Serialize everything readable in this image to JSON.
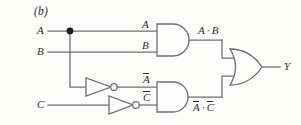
{
  "figure": {
    "panel_label": "(b)",
    "type": "logic-circuit-diagram",
    "colors": {
      "background": "#fdfdfc",
      "wire": "#6e6e6e",
      "text": "#2b2b2b",
      "junction": "#1c1c1c"
    }
  },
  "inputs": [
    {
      "name": "input-a",
      "label": "A"
    },
    {
      "name": "input-b",
      "label": "B"
    },
    {
      "name": "input-c",
      "label": "C"
    }
  ],
  "output": {
    "name": "output-y",
    "label": "Y"
  },
  "gate_input_labels": {
    "and1_top": "A",
    "and1_bottom": "B",
    "and2_top": "A",
    "and2_top_overbar": true,
    "and2_bottom": "C",
    "and2_bottom_overbar": true
  },
  "intermediate_labels": {
    "and1_output": {
      "left": "A",
      "sep": "·",
      "right": "B"
    },
    "and2_output": {
      "left": "A",
      "sep": "·",
      "right": "C"
    }
  },
  "gates": [
    {
      "name": "and-gate-1",
      "type": "AND",
      "inputs": [
        "A",
        "B"
      ],
      "output": "A · B"
    },
    {
      "name": "not-gate-a",
      "type": "NOT",
      "inputs": [
        "A"
      ],
      "output": "Ā"
    },
    {
      "name": "not-gate-c",
      "type": "NOT",
      "inputs": [
        "C"
      ],
      "output": "C̄"
    },
    {
      "name": "and-gate-2",
      "type": "AND",
      "inputs": [
        "Ā",
        "C̄"
      ],
      "output": "Ā · C̄"
    },
    {
      "name": "or-gate-1",
      "type": "OR",
      "inputs": [
        "A · B",
        "Ā · C̄"
      ],
      "output": "Y"
    }
  ],
  "expression": "Y = A·B + Ā·C̄"
}
